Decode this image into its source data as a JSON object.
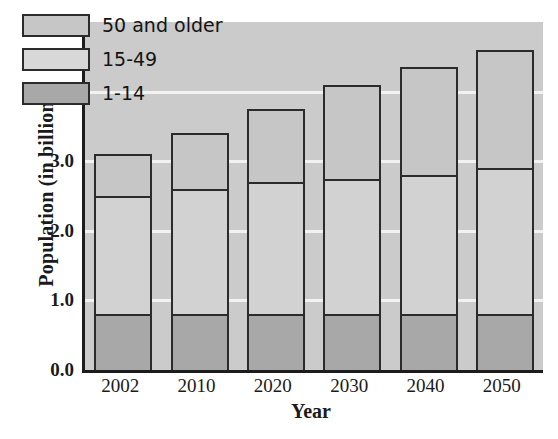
{
  "chart_data": {
    "type": "bar",
    "stacked": true,
    "title": "",
    "xlabel": "Year",
    "ylabel": "Population (in billions)",
    "categories": [
      "2002",
      "2010",
      "2020",
      "2030",
      "2040",
      "2050"
    ],
    "ylim": [
      0.0,
      5.0
    ],
    "yticks": [
      "0.0",
      "1.0",
      "2.0",
      "3.0",
      "4.0",
      "5.0"
    ],
    "ytick_values": [
      0.0,
      1.0,
      2.0,
      3.0,
      4.0,
      5.0
    ],
    "grid": "horizontal-white-gridlines",
    "legend_position": "upper-left-inside",
    "series": [
      {
        "name": "1-14",
        "values": [
          0.8,
          0.8,
          0.8,
          0.8,
          0.8,
          0.8
        ],
        "color": "#a8a8a8"
      },
      {
        "name": "15-49",
        "values": [
          1.7,
          1.8,
          1.9,
          1.95,
          2.0,
          2.1
        ],
        "color": "#d2d2d2"
      },
      {
        "name": "50 and older",
        "values": [
          0.6,
          0.8,
          1.05,
          1.35,
          1.55,
          1.7
        ],
        "color": "#c6c6c6"
      }
    ],
    "totals": [
      3.1,
      3.4,
      3.75,
      4.1,
      4.35,
      4.6
    ],
    "cumulative_tops": {
      "1-14": [
        0.8,
        0.8,
        0.8,
        0.8,
        0.8,
        0.8
      ],
      "15-49": [
        2.5,
        2.6,
        2.7,
        2.75,
        2.8,
        2.9
      ],
      "50 and older": [
        3.1,
        3.4,
        3.75,
        4.1,
        4.35,
        4.6
      ]
    }
  },
  "legend": {
    "items": [
      {
        "label": "50 and older",
        "color": "#c6c6c6"
      },
      {
        "label": "15-49",
        "color": "#d8d8d8"
      },
      {
        "label": "1-14",
        "color": "#a8a8a8"
      }
    ]
  },
  "axes": {
    "y_label": "Population (in billions)",
    "x_label": "Year",
    "y_ticks": [
      "5.0",
      "4.0",
      "3.0",
      "2.0",
      "1.0",
      "0.0"
    ],
    "x_ticks": [
      "2002",
      "2010",
      "2020",
      "2030",
      "2040",
      "2050"
    ]
  },
  "colors": {
    "plot_background": "#cbcbcb",
    "gridline": "#f2f2f2",
    "axis": "#1c1c1c",
    "bar_outline": "#2b2b2b",
    "seg_young": "#a8a8a8",
    "seg_middle": "#d2d2d2",
    "seg_old": "#c6c6c6"
  }
}
